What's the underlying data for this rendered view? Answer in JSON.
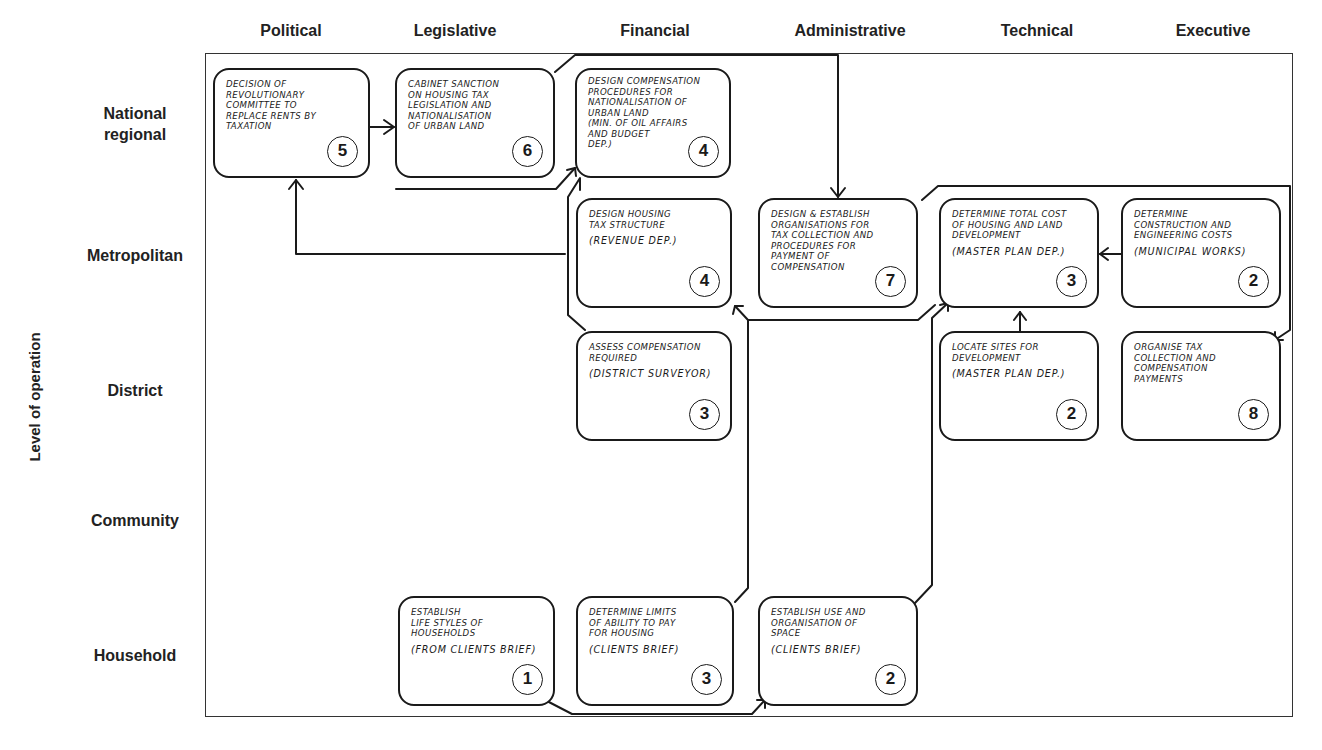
{
  "columns": [
    {
      "label": "Political"
    },
    {
      "label": "Legislative"
    },
    {
      "label": "Financial"
    },
    {
      "label": "Administrative"
    },
    {
      "label": "Technical"
    },
    {
      "label": "Executive"
    }
  ],
  "rows": [
    {
      "label": "National\nregional"
    },
    {
      "label": "Metropolitan"
    },
    {
      "label": "District"
    },
    {
      "label": "Community"
    },
    {
      "label": "Household"
    }
  ],
  "axis_label": "Level of operation",
  "boxes": [
    {
      "id": "political-national",
      "column": "Political",
      "row": "National regional",
      "lines": [
        "Decision of",
        "revolutionary",
        "committee to",
        "replace rents by",
        "taxation"
      ],
      "note": "",
      "step": "5"
    },
    {
      "id": "legislative-national",
      "column": "Legislative",
      "row": "National regional",
      "lines": [
        "Cabinet sanction",
        "on housing tax",
        "legislation and",
        "nationalisation",
        "of urban land"
      ],
      "note": "",
      "step": "6"
    },
    {
      "id": "financial-national",
      "column": "Financial",
      "row": "National regional",
      "lines": [
        "Design compensation",
        "procedures for",
        "nationalisation of",
        "urban land",
        "(Min. of oil affairs",
        "and budget",
        "dep.)"
      ],
      "note": "",
      "step": "4"
    },
    {
      "id": "financial-metropolitan",
      "column": "Financial",
      "row": "Metropolitan",
      "lines": [
        "Design housing",
        "tax structure"
      ],
      "note": "(Revenue dep.)",
      "step": "4"
    },
    {
      "id": "administrative-metropolitan",
      "column": "Administrative",
      "row": "Metropolitan",
      "lines": [
        "Design & establish",
        "organisations for",
        "tax collection and",
        "procedures for",
        "payment of",
        "compensation"
      ],
      "note": "",
      "step": "7"
    },
    {
      "id": "technical-metropolitan",
      "column": "Technical",
      "row": "Metropolitan",
      "lines": [
        "Determine total cost",
        "of housing and land",
        "development"
      ],
      "note": "(Master plan dep.)",
      "step": "3"
    },
    {
      "id": "executive-metropolitan",
      "column": "Executive",
      "row": "Metropolitan",
      "lines": [
        "Determine",
        "construction and",
        "engineering costs"
      ],
      "note": "(Municipal works)",
      "step": "2"
    },
    {
      "id": "financial-district",
      "column": "Financial",
      "row": "District",
      "lines": [
        "Assess compensation",
        "required"
      ],
      "note": "(District surveyor)",
      "step": "3"
    },
    {
      "id": "technical-district",
      "column": "Technical",
      "row": "District",
      "lines": [
        "Locate sites for",
        "development"
      ],
      "note": "(Master plan dep.)",
      "step": "2"
    },
    {
      "id": "executive-district",
      "column": "Executive",
      "row": "District",
      "lines": [
        "Organise tax",
        "collection and",
        "compensation",
        "payments"
      ],
      "note": "",
      "step": "8"
    },
    {
      "id": "legislative-household",
      "column": "Legislative",
      "row": "Household",
      "lines": [
        "Establish",
        "life styles of",
        "households"
      ],
      "note": "(From clients brief)",
      "step": "1"
    },
    {
      "id": "financial-household",
      "column": "Financial",
      "row": "Household",
      "lines": [
        "Determine limits",
        "of ability to pay",
        "for housing"
      ],
      "note": "(Clients brief)",
      "step": "3"
    },
    {
      "id": "administrative-household",
      "column": "Administrative",
      "row": "Household",
      "lines": [
        "Establish use and",
        "organisation of",
        "space"
      ],
      "note": "(Clients brief)",
      "step": "2"
    }
  ],
  "connections": [
    {
      "from": "political-national",
      "to": "legislative-national"
    },
    {
      "from": "legislative-national",
      "to": "administrative-metropolitan"
    },
    {
      "from": "financial-metropolitan",
      "to": "political-national"
    },
    {
      "from": "financial-metropolitan",
      "to": "financial-national"
    },
    {
      "from": "financial-district",
      "to": "financial-national"
    },
    {
      "from": "administrative-metropolitan",
      "to": "executive-district"
    },
    {
      "from": "technical-metropolitan",
      "to": "financial-metropolitan"
    },
    {
      "from": "executive-metropolitan",
      "to": "technical-metropolitan"
    },
    {
      "from": "technical-district",
      "to": "technical-metropolitan"
    },
    {
      "from": "administrative-household",
      "to": "technical-metropolitan"
    },
    {
      "from": "financial-household",
      "to": "financial-metropolitan"
    },
    {
      "from": "legislative-household",
      "to": "administrative-household"
    }
  ]
}
